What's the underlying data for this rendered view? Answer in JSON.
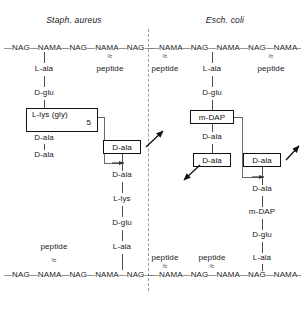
{
  "figure": {
    "type": "diagram",
    "panels": [
      {
        "id": "staph",
        "title": "Staph. aureus",
        "top_backbone": "—NAG—NAMA—NAG—NAMA—NAG—",
        "bottom_backbone": "—NAG—NAMA—NAG—NAMA—NAG—",
        "top_labels": [
          "L-ala",
          "peptide"
        ],
        "bottom_labels": [
          "peptide",
          "L-ala"
        ],
        "stem_down": [
          "L-ala",
          "D-glu"
        ],
        "bridge_box_main": "L-lys  (gly)",
        "bridge_box_sub": "5",
        "stem_tail": [
          "D-ala",
          "D-ala"
        ],
        "acceptor_box": "D-ala",
        "acceptor_chain": [
          "D-ala",
          "L-lys",
          "D-glu",
          "L-ala"
        ]
      },
      {
        "id": "ecoli",
        "title": "Esch. coli",
        "top_backbone": "—NAMA—NAG—NAMA—NAG—NAMA—",
        "bottom_backbone": "—NAMA—NAG—NAMA—NAG—NAMA—",
        "top_labels": [
          "peptide",
          "L-ala",
          "peptide"
        ],
        "bottom_labels": [
          "peptide",
          "peptide",
          "L-ala"
        ],
        "stem_down": [
          "L-ala",
          "D-glu"
        ],
        "bridge_box_main": "m-DAP",
        "stem_tail": [
          "D-ala"
        ],
        "released_box": "D-ala",
        "acceptor_box": "D-ala",
        "acceptor_chain": [
          "D-ala",
          "m-DAP",
          "D-glu",
          "L-ala"
        ]
      }
    ],
    "squiggle_glyph": "≈"
  }
}
